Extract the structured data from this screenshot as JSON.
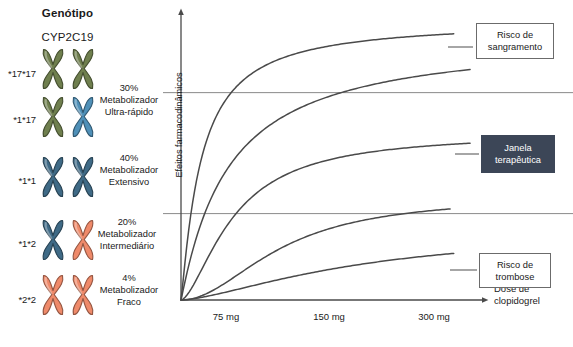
{
  "legend": {
    "title": "Genótipo",
    "subtitle": "CYP2C19",
    "rows": [
      {
        "genotype": "*17*17",
        "chrom_left_color": "#6f7f4e",
        "chrom_right_color": "#6f7f4e",
        "icon": "chromosome-pair-icon"
      },
      {
        "genotype": "*1*17",
        "chrom_left_color": "#6f7f4e",
        "chrom_right_color": "#4f90b8",
        "icon": "chromosome-pair-icon"
      },
      {
        "genotype": "*1*1",
        "chrom_left_color": "#3f6a86",
        "chrom_right_color": "#3f6a86",
        "icon": "chromosome-pair-icon"
      },
      {
        "genotype": "*1*2",
        "chrom_left_color": "#3f6a86",
        "chrom_right_color": "#ef8a6a",
        "icon": "chromosome-pair-icon"
      },
      {
        "genotype": "*2*2",
        "chrom_left_color": "#ef8a6a",
        "chrom_right_color": "#ef8a6a",
        "icon": "chromosome-pair-icon"
      }
    ],
    "phenotypes": [
      {
        "percent": "30%",
        "line2": "Metabolizador",
        "line3": "Ultra-rápido"
      },
      {
        "percent": "40%",
        "line2": "Metabolizador",
        "line3": "Extensivo"
      },
      {
        "percent": "20%",
        "line2": "Metabolizador",
        "line3": "Intermediário"
      },
      {
        "percent": "4%",
        "line2": "Metabolizador",
        "line3": "Fraco"
      }
    ]
  },
  "chart_data": {
    "type": "line",
    "title": "",
    "xlabel": "Dose de clopidogrel",
    "ylabel": "Efeitos farmacodinâmicos",
    "x_ticks": [
      "75 mg",
      "150 mg",
      "300 mg"
    ],
    "x_tick_positions": [
      75,
      150,
      300
    ],
    "grid": false,
    "legend_position": "right-callouts",
    "xlim": [
      0,
      330
    ],
    "ylim": [
      0,
      100
    ],
    "thresholds": [
      {
        "name": "upper-therapeutic-threshold",
        "y": 72
      },
      {
        "name": "lower-therapeutic-threshold",
        "y": 30
      }
    ],
    "series": [
      {
        "name": "*17*17 — Ultra-rápido (30%)",
        "emax": 97,
        "ec50": 22,
        "hill": 1.15,
        "x_end": 300,
        "color": "#4a4a4a"
      },
      {
        "name": "*1*17 — Ultra-rápido",
        "emax": 92,
        "ec50": 52,
        "hill": 1.05,
        "x_end": 318,
        "color": "#4a4a4a"
      },
      {
        "name": "*1*1 — Extensivo (40%)",
        "emax": 58,
        "ec50": 58,
        "hill": 1.6,
        "x_end": 318,
        "color": "#4a4a4a"
      },
      {
        "name": "*1*2 — Intermediário (20%)",
        "emax": 36,
        "ec50": 110,
        "hill": 2.0,
        "x_end": 296,
        "color": "#4a4a4a"
      },
      {
        "name": "*2*2 — Fraco (4%)",
        "emax": 25,
        "ec50": 200,
        "hill": 1.5,
        "x_end": 300,
        "color": "#4a4a4a"
      }
    ],
    "annotations": [
      {
        "name": "bleeding-risk",
        "line1": "Risco de",
        "line2": "sangramento",
        "style": "outline"
      },
      {
        "name": "therapeutic-window",
        "line1": "Janela",
        "line2": "terapêutica",
        "style": "filled"
      },
      {
        "name": "thrombosis-risk",
        "line1": "Risco de",
        "line2": "trombose",
        "style": "outline"
      }
    ]
  },
  "colors": {
    "axis": "#4a4a4a",
    "curve": "#4a4a4a",
    "threshold": "#8a8a8a",
    "filled_box": "#3c4657"
  }
}
